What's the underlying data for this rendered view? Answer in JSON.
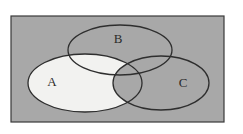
{
  "figure": {
    "kind": "venn-diagram",
    "title": "",
    "caption": "",
    "canvas": {
      "width": 243,
      "height": 134,
      "background": "#ffffff"
    }
  },
  "universe": {
    "name": "universal-set-rectangle",
    "label": "",
    "x": 11,
    "y": 16,
    "width": 213,
    "height": 106,
    "fill": "#a8a8a8",
    "stroke": "#3a3a3a",
    "stroke_width": 1.2
  },
  "sets": [
    {
      "id": "A",
      "label": "A",
      "cx": 85,
      "cy": 83,
      "rx": 57,
      "ry": 29,
      "rotation": 0,
      "fill": "#f2f2f0",
      "shaded": true,
      "stroke": "#2e2e2e",
      "stroke_width": 1.3,
      "label_x": 52,
      "label_y": 83
    },
    {
      "id": "B",
      "label": "B",
      "cx": 120,
      "cy": 50,
      "rx": 52,
      "ry": 25,
      "rotation": 0,
      "fill": "none",
      "shaded": false,
      "stroke": "#2e2e2e",
      "stroke_width": 1.3,
      "label_x": 118,
      "label_y": 40
    },
    {
      "id": "C",
      "label": "C",
      "cx": 161,
      "cy": 83,
      "rx": 48,
      "ry": 27,
      "rotation": 0,
      "fill": "none",
      "shaded": false,
      "stroke": "#2e2e2e",
      "stroke_width": 1.3,
      "label_x": 183,
      "label_y": 84
    }
  ],
  "shading": {
    "description": "A minus C",
    "regions_filled": [
      "A-only",
      "A-and-B-not-C"
    ],
    "regions_unfilled": [
      "B-only",
      "C-only",
      "A-and-C",
      "A-and-B-and-C",
      "B-and-C",
      "outside"
    ],
    "fill_color": "#f2f2f0",
    "background_color": "#a8a8a8"
  },
  "colors": {
    "page_background": "#ffffff",
    "universe_fill": "#a8a8a8",
    "shaded_fill": "#f2f2f0",
    "outline": "#2e2e2e",
    "label_text": "#2b2b2b",
    "rect_border": "#3a3a3a"
  }
}
